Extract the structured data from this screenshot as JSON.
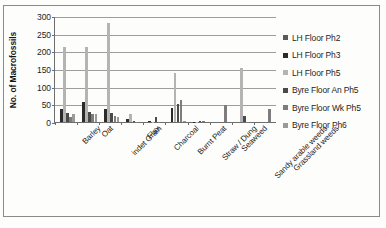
{
  "chart_data": {
    "type": "bar",
    "title": "",
    "xlabel": "",
    "ylabel": "No. of Macrofossils",
    "ylim": [
      0,
      300
    ],
    "yticks": [
      0,
      50,
      100,
      150,
      200,
      250,
      300
    ],
    "grid": true,
    "legend_position": "right",
    "categories": [
      "Barley",
      "Oat",
      "indet Grain",
      "Flax",
      "Charcoal",
      "Burnt Peat",
      "Straw / Dung",
      "Seaweed",
      "Sandy arable weeds",
      "Grassland weeds"
    ],
    "series": [
      {
        "name": "LH Floor Ph2",
        "color": "#5a5a5a",
        "values": [
          0,
          0,
          0,
          0,
          0,
          0,
          0,
          0,
          0,
          0
        ]
      },
      {
        "name": "LH Floor Ph3",
        "color": "#2b2b2b",
        "values": [
          38,
          56,
          37,
          8,
          2,
          39,
          1,
          0,
          0,
          0
        ]
      },
      {
        "name": "LH Floor Ph5",
        "color": "#b4b4b4",
        "values": [
          212,
          213,
          281,
          24,
          1,
          140,
          1,
          0,
          153,
          0
        ]
      },
      {
        "name": "Byre Floor An Ph5",
        "color": "#4a4a4a",
        "values": [
          25,
          27,
          26,
          2,
          14,
          52,
          4,
          0,
          16,
          0
        ]
      },
      {
        "name": "Byre Floor Wk Ph5",
        "color": "#7d7d7d",
        "values": [
          14,
          22,
          16,
          1,
          1,
          61,
          3,
          47,
          1,
          38
        ]
      },
      {
        "name": "Byre Floor Ph6",
        "color": "#9a9a9a",
        "values": [
          22,
          22,
          13,
          0,
          0,
          2,
          0,
          0,
          0,
          0
        ]
      }
    ]
  }
}
